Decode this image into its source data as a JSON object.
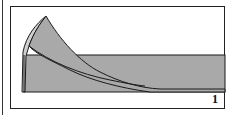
{
  "diagram": {
    "type": "origami-fold-step",
    "step_number": "1",
    "colors": {
      "paper_fill": "#a9a9a9",
      "flap_light": "#cfcfcf",
      "outline": "#1a1a1a",
      "frame": "#222222",
      "background": "#ffffff"
    },
    "elements": [
      {
        "name": "paper-strip",
        "description": "horizontal gray strip of paper"
      },
      {
        "name": "folded-flap",
        "description": "curved triangular flap lifted from left end"
      },
      {
        "name": "step-number",
        "value": "1"
      }
    ]
  }
}
